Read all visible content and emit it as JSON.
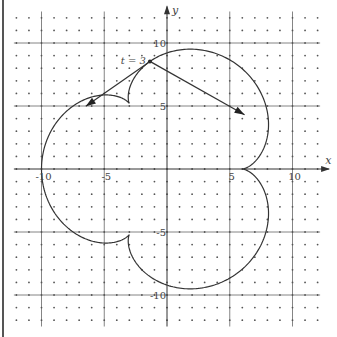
{
  "chart_data": {
    "type": "line",
    "title": "",
    "xlabel": "x",
    "ylabel": "y",
    "xlim": [
      -12,
      12
    ],
    "ylim": [
      -12,
      12
    ],
    "grid": true,
    "grid_major_step": 5,
    "grid_dot_step": 1,
    "x_ticks": [
      {
        "value": -10,
        "label": "-10"
      },
      {
        "value": -5,
        "label": "-5"
      },
      {
        "value": 5,
        "label": "5"
      },
      {
        "value": 10,
        "label": "10"
      }
    ],
    "y_ticks": [
      {
        "value": 10,
        "label": "10"
      },
      {
        "value": 5,
        "label": "5"
      },
      {
        "value": -5,
        "label": "-5"
      },
      {
        "value": -10,
        "label": "-10"
      }
    ],
    "series": [
      {
        "name": "epicycloid",
        "parametric": {
          "x": "8cos(t/2) - 2cos(2t)",
          "y": "8sin(t/2) - 2sin(2t)",
          "t_range": [
            0,
            12.566
          ]
        },
        "key_points": [
          {
            "x": 6,
            "y": 0,
            "note": "cusp"
          },
          {
            "x": -3,
            "y": 5.2,
            "note": "cusp"
          },
          {
            "x": -3,
            "y": -5.2,
            "note": "cusp"
          },
          {
            "x": -10,
            "y": 0
          },
          {
            "x": 1.85,
            "y": 9.51
          },
          {
            "x": 1.85,
            "y": -9.51
          }
        ]
      }
    ],
    "annotations": [
      {
        "type": "point",
        "label": "t = 3",
        "t": 3,
        "x": -1.36,
        "y": 8.54
      },
      {
        "type": "vector",
        "name": "velocity",
        "from": [
          -1.36,
          8.54
        ],
        "components": [
          -5.11,
          -3.56
        ]
      },
      {
        "type": "vector",
        "name": "acceleration",
        "from": [
          -1.36,
          8.54
        ],
        "components": [
          7.54,
          -4.23
        ]
      }
    ]
  }
}
